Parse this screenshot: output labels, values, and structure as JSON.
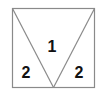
{
  "diagram": {
    "shape": "square divided by an inverted triangle into three regions",
    "stroke_color": "#8a8a8a",
    "label_color": "#111111",
    "regions": [
      {
        "id": "center-triangle",
        "label": "1"
      },
      {
        "id": "left-triangle",
        "label": "2"
      },
      {
        "id": "right-triangle",
        "label": "2"
      }
    ]
  }
}
